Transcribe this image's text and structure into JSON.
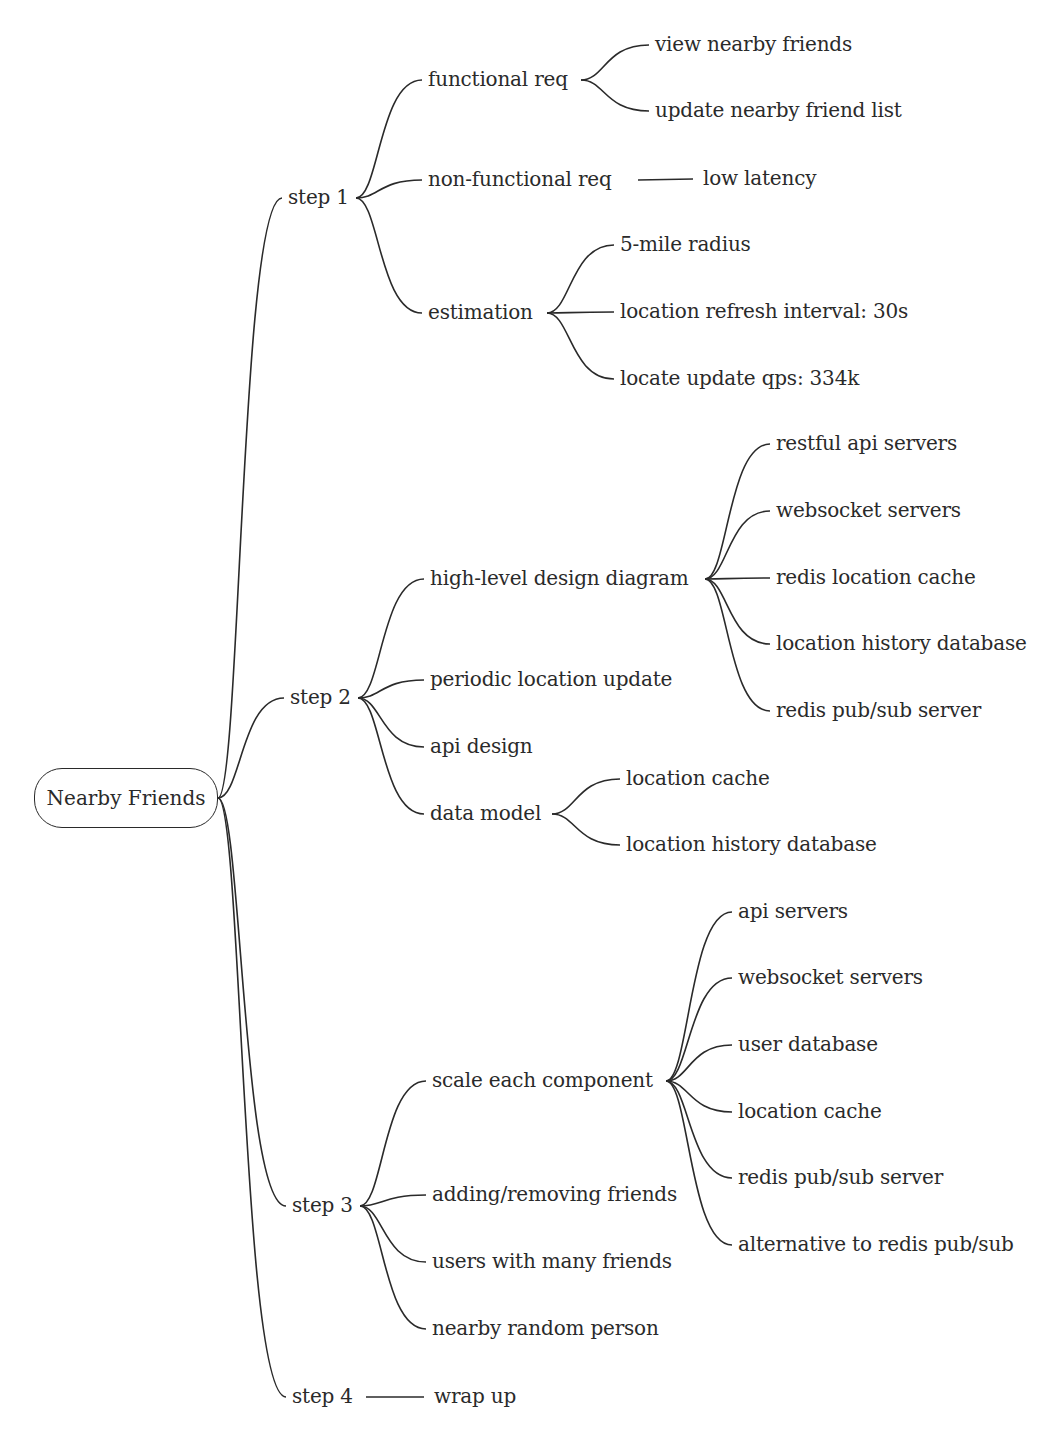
{
  "root": {
    "label": "Nearby Friends",
    "x": 34,
    "y": 768,
    "w": 184,
    "h": 60
  },
  "nodes": [
    {
      "id": "step1",
      "label": "step 1",
      "x": 288,
      "y": 198,
      "parent": "root"
    },
    {
      "id": "functional_req",
      "label": "functional req",
      "x": 428,
      "y": 80,
      "parent": "step1"
    },
    {
      "id": "view_nearby",
      "label": "view nearby friends",
      "x": 655,
      "y": 45,
      "parent": "functional_req"
    },
    {
      "id": "update_list",
      "label": "update nearby friend list",
      "x": 655,
      "y": 111,
      "parent": "functional_req"
    },
    {
      "id": "nonfunc_req",
      "label": "non-functional req",
      "x": 428,
      "y": 180,
      "parent": "step1"
    },
    {
      "id": "low_latency",
      "label": "low latency",
      "x": 703,
      "y": 179,
      "parent": "nonfunc_req",
      "straight": true
    },
    {
      "id": "estimation",
      "label": "estimation",
      "x": 428,
      "y": 313,
      "parent": "step1"
    },
    {
      "id": "mile_radius",
      "label": "5-mile radius",
      "x": 620,
      "y": 245,
      "parent": "estimation"
    },
    {
      "id": "refresh_interval",
      "label": "location refresh interval: 30s",
      "x": 620,
      "y": 312,
      "parent": "estimation"
    },
    {
      "id": "update_qps",
      "label": "locate update qps: 334k",
      "x": 620,
      "y": 379,
      "parent": "estimation"
    },
    {
      "id": "step2",
      "label": "step 2",
      "x": 290,
      "y": 698,
      "parent": "root"
    },
    {
      "id": "hld",
      "label": "high-level design diagram",
      "x": 430,
      "y": 579,
      "parent": "step2"
    },
    {
      "id": "restful",
      "label": "restful api servers",
      "x": 776,
      "y": 444,
      "parent": "hld"
    },
    {
      "id": "ws_servers",
      "label": "websocket servers",
      "x": 776,
      "y": 511,
      "parent": "hld"
    },
    {
      "id": "redis_loc_cache",
      "label": "redis location cache",
      "x": 776,
      "y": 578,
      "parent": "hld"
    },
    {
      "id": "loc_hist_db",
      "label": "location history database",
      "x": 776,
      "y": 644,
      "parent": "hld"
    },
    {
      "id": "redis_pubsub",
      "label": "redis pub/sub server",
      "x": 776,
      "y": 711,
      "parent": "hld"
    },
    {
      "id": "periodic",
      "label": "periodic location update",
      "x": 430,
      "y": 680,
      "parent": "step2"
    },
    {
      "id": "api_design",
      "label": "api design",
      "x": 430,
      "y": 747,
      "parent": "step2"
    },
    {
      "id": "data_model",
      "label": "data model",
      "x": 430,
      "y": 814,
      "parent": "step2"
    },
    {
      "id": "dm_loc_cache",
      "label": "location cache",
      "x": 626,
      "y": 779,
      "parent": "data_model"
    },
    {
      "id": "dm_loc_hist",
      "label": "location history database",
      "x": 626,
      "y": 845,
      "parent": "data_model"
    },
    {
      "id": "step3",
      "label": "step 3",
      "x": 292,
      "y": 1206,
      "parent": "root"
    },
    {
      "id": "scale",
      "label": "scale each component",
      "x": 432,
      "y": 1081,
      "parent": "step3"
    },
    {
      "id": "api_servers",
      "label": "api servers",
      "x": 738,
      "y": 912,
      "parent": "scale"
    },
    {
      "id": "ws_servers2",
      "label": "websocket servers",
      "x": 738,
      "y": 978,
      "parent": "scale"
    },
    {
      "id": "user_db",
      "label": "user database",
      "x": 738,
      "y": 1045,
      "parent": "scale"
    },
    {
      "id": "loc_cache2",
      "label": "location cache",
      "x": 738,
      "y": 1112,
      "parent": "scale"
    },
    {
      "id": "redis_pubsub2",
      "label": "redis pub/sub server",
      "x": 738,
      "y": 1178,
      "parent": "scale"
    },
    {
      "id": "alt_pubsub",
      "label": "alternative to redis pub/sub",
      "x": 738,
      "y": 1245,
      "parent": "scale"
    },
    {
      "id": "adding",
      "label": "adding/removing friends",
      "x": 432,
      "y": 1195,
      "parent": "step3"
    },
    {
      "id": "many_friends",
      "label": "users with many friends",
      "x": 432,
      "y": 1262,
      "parent": "step3"
    },
    {
      "id": "random_person",
      "label": "nearby random person",
      "x": 432,
      "y": 1329,
      "parent": "step3"
    },
    {
      "id": "step4",
      "label": "step 4",
      "x": 292,
      "y": 1397,
      "parent": "root"
    },
    {
      "id": "wrap_up",
      "label": "wrap up",
      "x": 434,
      "y": 1397,
      "parent": "step4",
      "straight": true
    }
  ],
  "anchors": {
    "root": [
      218,
      798
    ],
    "step1": [
      356,
      198
    ],
    "functional_req": [
      581,
      80
    ],
    "nonfunc_req": [
      632,
      180
    ],
    "estimation": [
      547,
      313
    ],
    "step2": [
      358,
      698
    ],
    "hld": [
      705,
      579
    ],
    "data_model": [
      552,
      814
    ],
    "step3": [
      360,
      1206
    ],
    "scale": [
      666,
      1081
    ],
    "step4": [
      360,
      1397
    ]
  },
  "style": {
    "stroke": "#2a2a2a",
    "text": "#2a2a2a",
    "background": "#ffffff"
  }
}
